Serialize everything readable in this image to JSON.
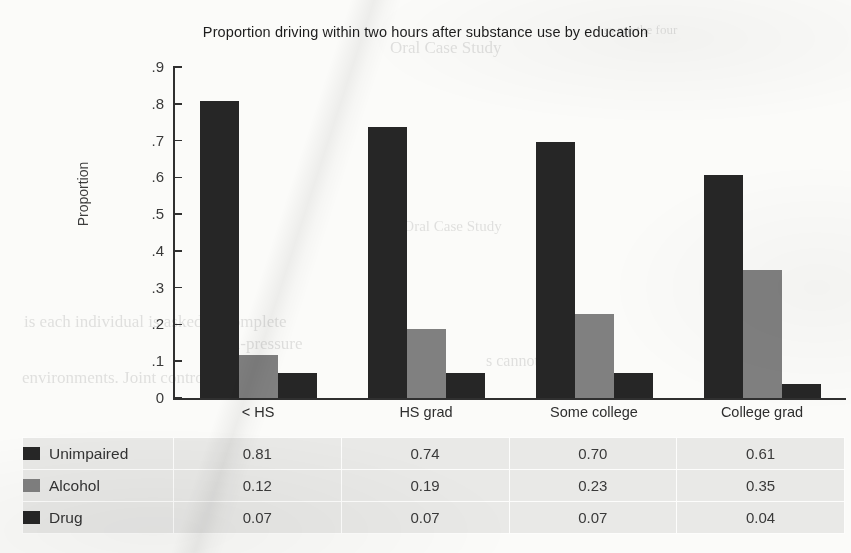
{
  "chart_data": {
    "type": "bar",
    "title": "Proportion driving within two hours after substance use by education",
    "xlabel": "",
    "ylabel": "Proportion",
    "ylim": [
      0,
      0.9
    ],
    "grid": false,
    "legend_position": "table-below",
    "categories": [
      "< HS",
      "HS grad",
      "Some college",
      "College grad"
    ],
    "ytick_labels": [
      ".9",
      ".8",
      ".7",
      ".6",
      ".5",
      ".4",
      ".3",
      ".2",
      ".1",
      "0"
    ],
    "ytick_values": [
      0.9,
      0.8,
      0.7,
      0.6,
      0.5,
      0.4,
      0.3,
      0.2,
      0.1,
      0
    ],
    "series": [
      {
        "name": "Unimpaired",
        "color": "#262626",
        "values": [
          0.81,
          0.74,
          0.7,
          0.61
        ],
        "labels": [
          "0.81",
          "0.74",
          "0.70",
          "0.61"
        ]
      },
      {
        "name": "Alcohol",
        "color": "#808080",
        "values": [
          0.12,
          0.19,
          0.23,
          0.35
        ],
        "labels": [
          "0.12",
          "0.19",
          "0.23",
          "0.35"
        ]
      },
      {
        "name": "Drug",
        "color": "#262626",
        "values": [
          0.07,
          0.07,
          0.07,
          0.04
        ],
        "labels": [
          "0.07",
          "0.07",
          "0.07",
          "0.04"
        ]
      }
    ]
  },
  "background_text": {
    "line1": "ss are the four",
    "line2": "Oral Case Study",
    "line3": "1 the Oral Case Study",
    "line4": "is each individual is asked to complete",
    "line5": "high-pressure",
    "line6": "s cannot clearly be",
    "line7": "environments. Joint control efforts"
  }
}
